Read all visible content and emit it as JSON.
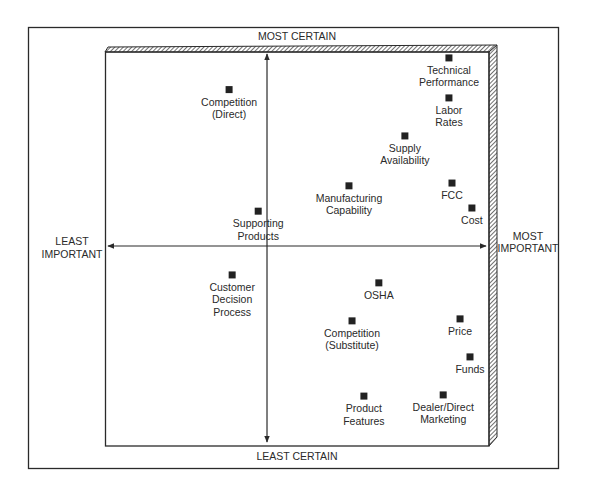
{
  "chart_data": {
    "type": "scatter",
    "title": "",
    "axis_labels": {
      "top": "MOST CERTAIN",
      "bottom": "LEAST CERTAIN",
      "left": [
        "LEAST",
        "IMPORTANT"
      ],
      "right": [
        "MOST",
        "IMPORTANT"
      ]
    },
    "xlabel": "Importance (least → most)",
    "ylabel": "Certainty (least → most)",
    "xlim": [
      0,
      10
    ],
    "ylim": [
      0,
      10
    ],
    "axis_crossing": {
      "x": 4.23,
      "y": 5.05
    },
    "grid": false,
    "legend": "none",
    "points": [
      {
        "name": "Competition (Direct)",
        "label_lines": [
          "Competition",
          "(Direct)"
        ],
        "x": 3.24,
        "y": 9.0
      },
      {
        "name": "Technical Performance",
        "label_lines": [
          "Technical",
          "Performance"
        ],
        "x": 8.98,
        "y": 9.8
      },
      {
        "name": "Labor Rates",
        "label_lines": [
          "Labor",
          "Rates"
        ],
        "x": 8.98,
        "y": 8.79
      },
      {
        "name": "Supply Availability",
        "label_lines": [
          "Supply",
          "Availability"
        ],
        "x": 7.83,
        "y": 7.83
      },
      {
        "name": "Manufacturing Capability",
        "label_lines": [
          "Manufacturing",
          "Capability"
        ],
        "x": 6.37,
        "y": 6.57
      },
      {
        "name": "FCC",
        "label_lines": [
          "FCC"
        ],
        "x": 9.06,
        "y": 6.64
      },
      {
        "name": "Cost",
        "label_lines": [
          "Cost"
        ],
        "x": 9.58,
        "y": 6.01
      },
      {
        "name": "Supporting Products",
        "label_lines": [
          "Supporting",
          "Products"
        ],
        "x": 4.0,
        "y": 5.93
      },
      {
        "name": "Customer Decision Process",
        "label_lines": [
          "Customer",
          "Decision",
          "Process"
        ],
        "x": 3.32,
        "y": 4.32
      },
      {
        "name": "OSHA",
        "label_lines": [
          "OSHA"
        ],
        "x": 7.15,
        "y": 4.12
      },
      {
        "name": "Competition (Substitute)",
        "label_lines": [
          "Competition",
          "(Substitute)"
        ],
        "x": 6.45,
        "y": 3.16
      },
      {
        "name": "Price",
        "label_lines": [
          "Price"
        ],
        "x": 9.27,
        "y": 3.21
      },
      {
        "name": "Funds",
        "label_lines": [
          "Funds"
        ],
        "x": 9.53,
        "y": 2.25
      },
      {
        "name": "Product Features",
        "label_lines": [
          "Product",
          "Features"
        ],
        "x": 6.76,
        "y": 1.26
      },
      {
        "name": "Dealer/Direct Marketing",
        "label_lines": [
          "Dealer/Direct",
          "Marketing"
        ],
        "x": 8.83,
        "y": 1.29
      }
    ]
  },
  "colors": {
    "ink": "#2a2a2a",
    "marker": "#222222",
    "background": "#ffffff"
  }
}
